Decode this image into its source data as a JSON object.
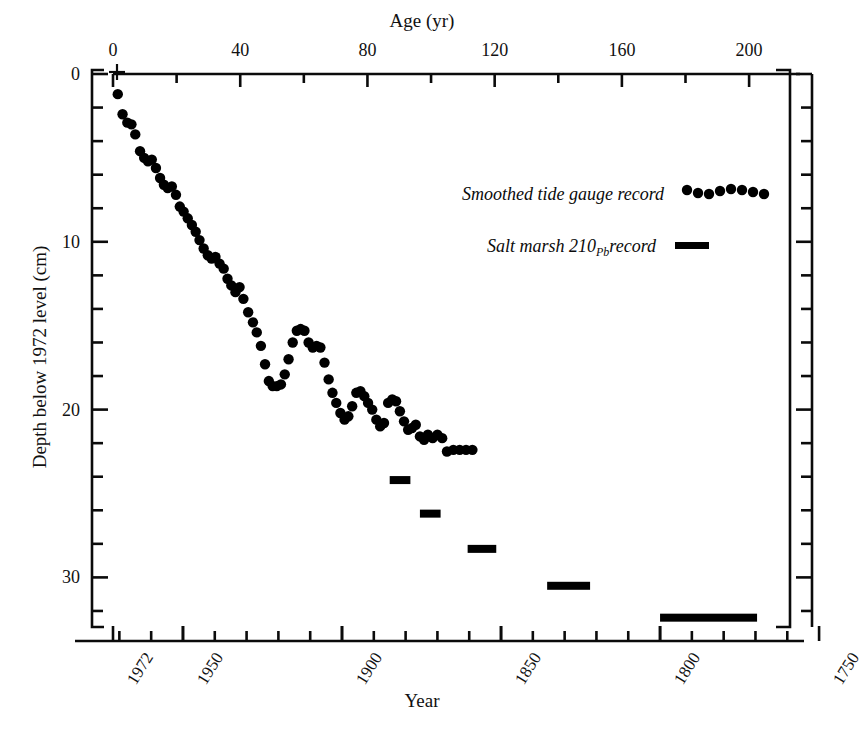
{
  "chart_data": {
    "type": "scatter",
    "title": "",
    "xlabel": "Year",
    "xlabel_top": "Age (yr)",
    "ylabel": "Depth below 1972 level (cm)",
    "grid": false,
    "legend_position": "upper-right",
    "axes": {
      "top": {
        "label": "Age (yr)",
        "ticks_major": [
          0,
          40,
          80,
          120,
          160,
          200
        ],
        "tick_labels": [
          "0",
          "40",
          "80",
          "120",
          "160",
          "200"
        ],
        "ticks_minor_step": 20,
        "range": [
          0,
          216
        ]
      },
      "bottom": {
        "label": "Year",
        "ticks_major": [
          1972,
          1950,
          1900,
          1850,
          1800,
          1750
        ],
        "tick_labels": [
          "1972",
          "1950",
          "1900",
          "1850",
          "1800",
          "1750"
        ],
        "ticks_minor_step": 10,
        "range": [
          1972,
          1756
        ]
      },
      "left": {
        "label": "Depth below 1972 level (cm)",
        "ticks_major": [
          0,
          10,
          20,
          30
        ],
        "tick_labels": [
          "0",
          "10",
          "20",
          "30"
        ],
        "ticks_minor_step": 2,
        "range": [
          0,
          34
        ],
        "direction": "inverted"
      },
      "right": {
        "ticks_minor_step": 2,
        "range": [
          0,
          34
        ]
      }
    },
    "reference_marker": {
      "symbol": "+",
      "age": 0,
      "depth": 0.0,
      "name": "1972-datum-cross"
    },
    "series": [
      {
        "name": "Smoothed tide gauge record",
        "marker": "filled-circle",
        "color": "#000000",
        "points": [
          [
            1.5,
            1.2
          ],
          [
            3.0,
            2.4
          ],
          [
            4.5,
            2.9
          ],
          [
            5.8,
            3.0
          ],
          [
            7.0,
            3.6
          ],
          [
            8.5,
            4.6
          ],
          [
            9.8,
            5.0
          ],
          [
            11.0,
            5.2
          ],
          [
            12.2,
            5.1
          ],
          [
            13.5,
            5.6
          ],
          [
            14.8,
            6.2
          ],
          [
            16.0,
            6.6
          ],
          [
            17.2,
            6.8
          ],
          [
            18.5,
            6.7
          ],
          [
            19.8,
            7.2
          ],
          [
            21.0,
            7.9
          ],
          [
            22.2,
            8.2
          ],
          [
            23.5,
            8.6
          ],
          [
            24.8,
            9.0
          ],
          [
            26.0,
            9.4
          ],
          [
            27.2,
            9.9
          ],
          [
            28.5,
            10.4
          ],
          [
            29.8,
            10.8
          ],
          [
            31.0,
            11.0
          ],
          [
            32.2,
            10.9
          ],
          [
            33.5,
            11.3
          ],
          [
            34.8,
            11.6
          ],
          [
            36.0,
            12.2
          ],
          [
            37.2,
            12.6
          ],
          [
            38.5,
            13.0
          ],
          [
            39.8,
            12.7
          ],
          [
            41.0,
            13.4
          ],
          [
            42.5,
            14.2
          ],
          [
            44.0,
            14.8
          ],
          [
            45.2,
            15.4
          ],
          [
            46.5,
            16.2
          ],
          [
            47.8,
            17.3
          ],
          [
            49.0,
            18.3
          ],
          [
            50.2,
            18.6
          ],
          [
            51.5,
            18.6
          ],
          [
            52.8,
            18.5
          ],
          [
            54.0,
            17.9
          ],
          [
            55.2,
            17.0
          ],
          [
            56.5,
            16.0
          ],
          [
            57.8,
            15.3
          ],
          [
            59.0,
            15.2
          ],
          [
            60.2,
            15.3
          ],
          [
            61.5,
            16.0
          ],
          [
            62.8,
            16.3
          ],
          [
            64.0,
            16.2
          ],
          [
            65.2,
            16.3
          ],
          [
            66.5,
            17.2
          ],
          [
            67.8,
            18.2
          ],
          [
            69.0,
            19.0
          ],
          [
            70.2,
            19.6
          ],
          [
            71.5,
            20.2
          ],
          [
            72.8,
            20.6
          ],
          [
            74.0,
            20.4
          ],
          [
            75.2,
            19.8
          ],
          [
            76.5,
            19.0
          ],
          [
            77.8,
            18.9
          ],
          [
            79.0,
            19.2
          ],
          [
            80.2,
            19.6
          ],
          [
            81.5,
            20.0
          ],
          [
            82.8,
            20.6
          ],
          [
            84.0,
            21.0
          ],
          [
            85.2,
            20.8
          ],
          [
            86.5,
            19.6
          ],
          [
            87.8,
            19.4
          ],
          [
            89.0,
            19.5
          ],
          [
            90.2,
            20.1
          ],
          [
            91.5,
            20.7
          ],
          [
            92.8,
            21.2
          ],
          [
            94.0,
            21.1
          ],
          [
            95.2,
            20.9
          ],
          [
            96.5,
            21.6
          ],
          [
            97.8,
            21.8
          ],
          [
            99.0,
            21.5
          ],
          [
            100.5,
            21.7
          ],
          [
            102.0,
            21.5
          ],
          [
            103.5,
            21.7
          ],
          [
            105.0,
            22.5
          ],
          [
            107.0,
            22.4
          ],
          [
            109.0,
            22.4
          ],
          [
            111.0,
            22.4
          ],
          [
            113.0,
            22.4
          ]
        ]
      },
      {
        "name": "Salt marsh 210Pb record",
        "marker": "thick-horizontal-bar",
        "color": "#000000",
        "bars": [
          {
            "age_start": 87.0,
            "age_end": 93.5,
            "depth": 24.2
          },
          {
            "age_start": 96.5,
            "age_end": 103.0,
            "depth": 26.2
          },
          {
            "age_start": 111.5,
            "age_end": 120.5,
            "depth": 28.3
          },
          {
            "age_start": 136.5,
            "age_end": 150.0,
            "depth": 30.5
          },
          {
            "age_start": 172.0,
            "age_end": 202.5,
            "depth": 32.4
          }
        ]
      }
    ],
    "legend": [
      {
        "label": "Smoothed tide gauge record",
        "marker": "dots"
      },
      {
        "label": "Salt marsh 210",
        "label_sub": "Pb",
        "label_tail": " record",
        "marker": "bar"
      }
    ]
  }
}
